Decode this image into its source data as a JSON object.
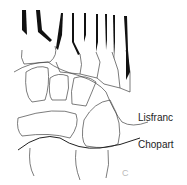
{
  "diagram": {
    "labels": {
      "lisfranc": "Lisfranc",
      "chopart": "Chopart"
    },
    "panel_letter": "C",
    "colors": {
      "outline": "#333333",
      "metatarsal_shading": "#111111",
      "background": "#ffffff"
    }
  }
}
